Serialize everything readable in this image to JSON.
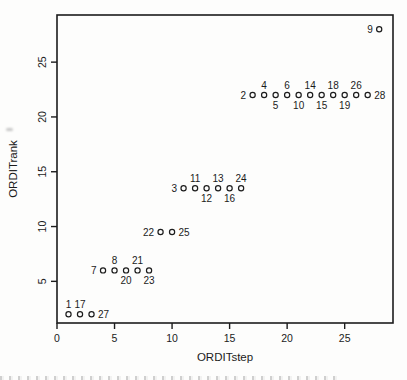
{
  "colors": {
    "ink": "#1c1c1c",
    "background": "#fdfdfc"
  },
  "chart_data": {
    "type": "scatter",
    "title": "",
    "xlabel": "ORDITstep",
    "ylabel": "ORDITrank",
    "xlim": [
      0,
      29.2
    ],
    "ylim": [
      1.2,
      29.3
    ],
    "xticks": [
      0,
      5,
      10,
      15,
      20,
      25
    ],
    "yticks": [
      5,
      10,
      15,
      20,
      25
    ],
    "grid": false,
    "legend": "none",
    "marker": "open-circle",
    "points": [
      {
        "label": "1",
        "x": 1,
        "y": 2,
        "label_pos": "above"
      },
      {
        "label": "17",
        "x": 2,
        "y": 2,
        "label_pos": "above"
      },
      {
        "label": "27",
        "x": 3,
        "y": 2,
        "label_pos": "right"
      },
      {
        "label": "7",
        "x": 4,
        "y": 6,
        "label_pos": "left"
      },
      {
        "label": "8",
        "x": 5,
        "y": 6,
        "label_pos": "above"
      },
      {
        "label": "20",
        "x": 6,
        "y": 6,
        "label_pos": "below"
      },
      {
        "label": "21",
        "x": 7,
        "y": 6,
        "label_pos": "above"
      },
      {
        "label": "23",
        "x": 8,
        "y": 6,
        "label_pos": "below"
      },
      {
        "label": "22",
        "x": 9,
        "y": 9.5,
        "label_pos": "left"
      },
      {
        "label": "25",
        "x": 10,
        "y": 9.5,
        "label_pos": "right"
      },
      {
        "label": "3",
        "x": 11,
        "y": 13.5,
        "label_pos": "left"
      },
      {
        "label": "11",
        "x": 12,
        "y": 13.5,
        "label_pos": "above"
      },
      {
        "label": "12",
        "x": 13,
        "y": 13.5,
        "label_pos": "below"
      },
      {
        "label": "13",
        "x": 14,
        "y": 13.5,
        "label_pos": "above"
      },
      {
        "label": "16",
        "x": 15,
        "y": 13.5,
        "label_pos": "below"
      },
      {
        "label": "24",
        "x": 16,
        "y": 13.5,
        "label_pos": "above"
      },
      {
        "label": "2",
        "x": 17,
        "y": 22,
        "label_pos": "left"
      },
      {
        "label": "4",
        "x": 18,
        "y": 22,
        "label_pos": "above"
      },
      {
        "label": "5",
        "x": 19,
        "y": 22,
        "label_pos": "below"
      },
      {
        "label": "6",
        "x": 20,
        "y": 22,
        "label_pos": "above"
      },
      {
        "label": "10",
        "x": 21,
        "y": 22,
        "label_pos": "below"
      },
      {
        "label": "14",
        "x": 22,
        "y": 22,
        "label_pos": "above"
      },
      {
        "label": "15",
        "x": 23,
        "y": 22,
        "label_pos": "below"
      },
      {
        "label": "18",
        "x": 24,
        "y": 22,
        "label_pos": "above"
      },
      {
        "label": "19",
        "x": 25,
        "y": 22,
        "label_pos": "below"
      },
      {
        "label": "26",
        "x": 26,
        "y": 22,
        "label_pos": "above"
      },
      {
        "label": "28",
        "x": 27,
        "y": 22,
        "label_pos": "right"
      },
      {
        "label": "9",
        "x": 28,
        "y": 28,
        "label_pos": "left"
      }
    ]
  }
}
